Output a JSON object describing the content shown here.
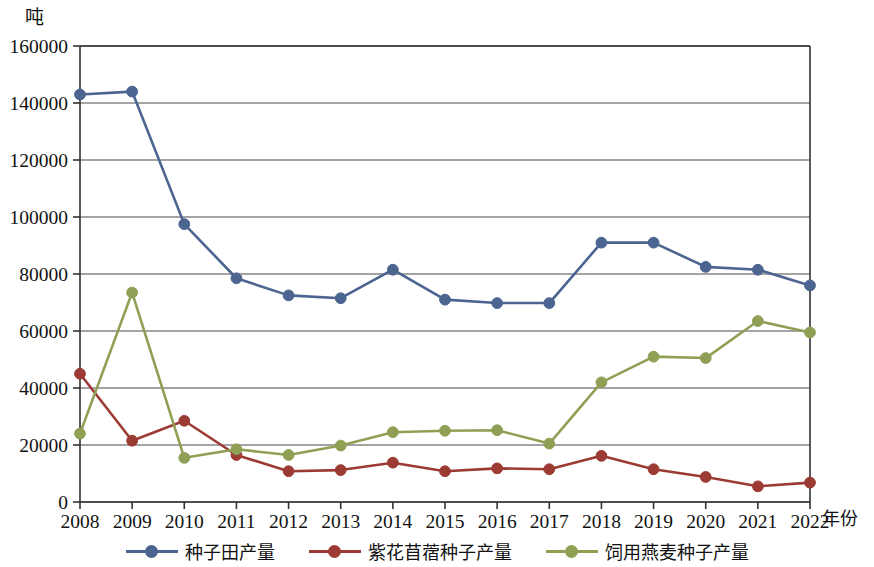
{
  "chart_data": {
    "type": "line",
    "title": "",
    "xlabel": "年份",
    "ylabel": "吨",
    "unit_label": "吨",
    "categories": [
      "2008",
      "2009",
      "2010",
      "2011",
      "2012",
      "2013",
      "2014",
      "2015",
      "2016",
      "2017",
      "2018",
      "2019",
      "2020",
      "2021",
      "2022"
    ],
    "x": [
      2008,
      2009,
      2010,
      2011,
      2012,
      2013,
      2014,
      2015,
      2016,
      2017,
      2018,
      2019,
      2020,
      2021,
      2022
    ],
    "ylim": [
      0,
      160000
    ],
    "ytick_values": [
      0,
      20000,
      40000,
      60000,
      80000,
      100000,
      120000,
      140000,
      160000
    ],
    "ytick_labels": [
      "0",
      "20000",
      "40000",
      "60000",
      "80000",
      "100000",
      "120000",
      "140000",
      "160000"
    ],
    "grid": true,
    "grid_axis": "y",
    "legend_position": "bottom",
    "series": [
      {
        "name": "种子田产量",
        "color": "#4C6490",
        "marker": "circle",
        "values": [
          143000,
          144000,
          97500,
          78500,
          72500,
          71500,
          81500,
          71000,
          69800,
          69800,
          91000,
          91000,
          82500,
          81500,
          76000
        ]
      },
      {
        "name": "紫花苜蓿种子产量",
        "color": "#9C3B33",
        "marker": "circle",
        "values": [
          45000,
          21500,
          28500,
          16500,
          10800,
          11200,
          13800,
          10800,
          11800,
          11500,
          16200,
          11500,
          8800,
          5500,
          6800
        ]
      },
      {
        "name": "饲用燕麦种子产量",
        "color": "#8FA055",
        "marker": "circle",
        "values": [
          24000,
          73500,
          15500,
          18500,
          16500,
          19800,
          24500,
          25000,
          25200,
          20500,
          42000,
          51000,
          50500,
          63500,
          59500
        ]
      }
    ]
  },
  "legend": {
    "items": [
      {
        "label": "种子田产量",
        "color": "#4C6490"
      },
      {
        "label": "紫花苜蓿种子产量",
        "color": "#9C3B33"
      },
      {
        "label": "饲用燕麦种子产量",
        "color": "#8FA055"
      }
    ]
  },
  "axes": {
    "y_unit": "吨",
    "x_title": "年份"
  }
}
